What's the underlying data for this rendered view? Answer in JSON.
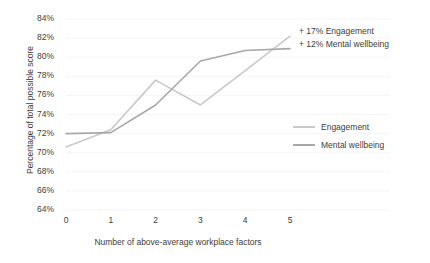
{
  "chart_data": {
    "type": "line",
    "title": "",
    "xlabel": "Number of above-average workplace factors",
    "ylabel": "Percentage of total possible score",
    "x": [
      0,
      1,
      2,
      3,
      4,
      5
    ],
    "xticklabels": [
      "0",
      "1",
      "2",
      "3",
      "4",
      "5"
    ],
    "yticklabels": [
      "64%",
      "66%",
      "68%",
      "70%",
      "72%",
      "74%",
      "76%",
      "78%",
      "80%",
      "82%",
      "84%"
    ],
    "yticks": [
      64,
      66,
      68,
      70,
      72,
      74,
      76,
      78,
      80,
      82,
      84
    ],
    "ylim": [
      64,
      84
    ],
    "xlim": [
      0,
      5
    ],
    "grid": true,
    "legend_position": "right",
    "series": [
      {
        "name": "Engagement",
        "color": "#c9c9c9",
        "values": [
          70.6,
          72.4,
          77.6,
          75.0,
          78.6,
          82.2
        ]
      },
      {
        "name": "Mental wellbeing",
        "color": "#a8a8a8",
        "values": [
          72.0,
          72.1,
          75.0,
          79.6,
          80.7,
          80.9
        ]
      }
    ],
    "annotations": [
      "+ 17% Engagement",
      "+ 12% Mental wellbeing"
    ]
  },
  "legend": {
    "items": [
      {
        "label": "Engagement"
      },
      {
        "label": "Mental wellbeing"
      }
    ]
  },
  "colors": {
    "engagement": "#c9c9c9",
    "mental_wellbeing": "#a8a8a8",
    "grid": "#f2f2f2",
    "text": "#3c3c3c"
  }
}
